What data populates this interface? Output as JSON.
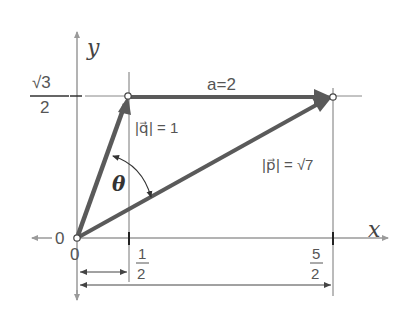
{
  "diagram": {
    "axes": {
      "x_label": "x",
      "y_label": "y",
      "origin_label": "0",
      "origin_left_label": "0"
    },
    "ticks": {
      "y_sqrt3_over_2": {
        "num": "√3",
        "den": "2"
      },
      "x_half": {
        "num": "1",
        "den": "2"
      },
      "x_five_halves": {
        "num": "5",
        "den": "2"
      }
    },
    "vectors": {
      "q": {
        "label": "|q⃗| = 1",
        "bar_text": "|",
        "letter": "q",
        "eq": "= 1",
        "from": [
          0,
          0
        ],
        "to": [
          0.5,
          0.866
        ]
      },
      "p": {
        "label": "|p⃗| = √7",
        "letter": "p",
        "eq": "= √7",
        "from": [
          0,
          0
        ],
        "to": [
          2.5,
          0.866
        ]
      },
      "a": {
        "label": "a=2",
        "from": [
          0.5,
          0.866
        ],
        "to": [
          2.5,
          0.866
        ]
      }
    },
    "angle_label": "θ",
    "colors": {
      "vector": "#5a5a5a",
      "axis": "#9a9a9a",
      "guide": "#777777",
      "text": "#555555"
    }
  }
}
